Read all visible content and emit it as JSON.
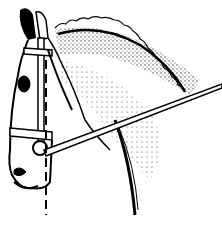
{
  "illustration": {
    "subject": "horse-head-with-bridle",
    "style": "black-and-white line drawing",
    "elements": [
      "braided-mane",
      "ears",
      "bridle",
      "noseband",
      "rein",
      "vertical-dashed-line"
    ],
    "colors": {
      "background": "#ffffff",
      "ink": "#000000"
    }
  }
}
